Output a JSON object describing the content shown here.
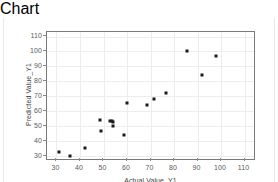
{
  "chart_data": {
    "type": "scatter",
    "title": "",
    "xlabel": "Actual Value_Y1",
    "ylabel": "Predicted Value_Y1",
    "xlim": [
      26,
      114
    ],
    "ylim": [
      28,
      113
    ],
    "xticks": [
      30,
      40,
      50,
      60,
      70,
      80,
      90,
      100,
      110
    ],
    "yticks": [
      30,
      40,
      50,
      60,
      70,
      80,
      90,
      100,
      110
    ],
    "grid": true,
    "legend": "none",
    "marker_color": "#1a1a1a",
    "marker_shape": "square",
    "points": [
      {
        "x": 31.2,
        "y": 32.6
      },
      {
        "x": 35.8,
        "y": 29.8
      },
      {
        "x": 42.3,
        "y": 35.2
      },
      {
        "x": 48.7,
        "y": 54.0
      },
      {
        "x": 48.9,
        "y": 46.8
      },
      {
        "x": 52.8,
        "y": 53.2
      },
      {
        "x": 53.6,
        "y": 53.3
      },
      {
        "x": 54.2,
        "y": 53.1
      },
      {
        "x": 54.0,
        "y": 50.2
      },
      {
        "x": 58.8,
        "y": 43.8
      },
      {
        "x": 60.2,
        "y": 65.2
      },
      {
        "x": 68.6,
        "y": 64.4
      },
      {
        "x": 71.6,
        "y": 68.3
      },
      {
        "x": 76.5,
        "y": 71.9
      },
      {
        "x": 85.7,
        "y": 100.3
      },
      {
        "x": 91.9,
        "y": 84.0
      },
      {
        "x": 97.8,
        "y": 97.2
      }
    ]
  },
  "axes": {
    "x_tick_labels": [
      "30",
      "40",
      "50",
      "60",
      "70",
      "80",
      "90",
      "100",
      "110"
    ],
    "y_tick_labels": [
      "30",
      "40",
      "50",
      "60",
      "70",
      "80",
      "90",
      "100",
      "110"
    ],
    "x_title": "Actual Value_Y1",
    "y_title": "Predicted Value_Y1"
  }
}
